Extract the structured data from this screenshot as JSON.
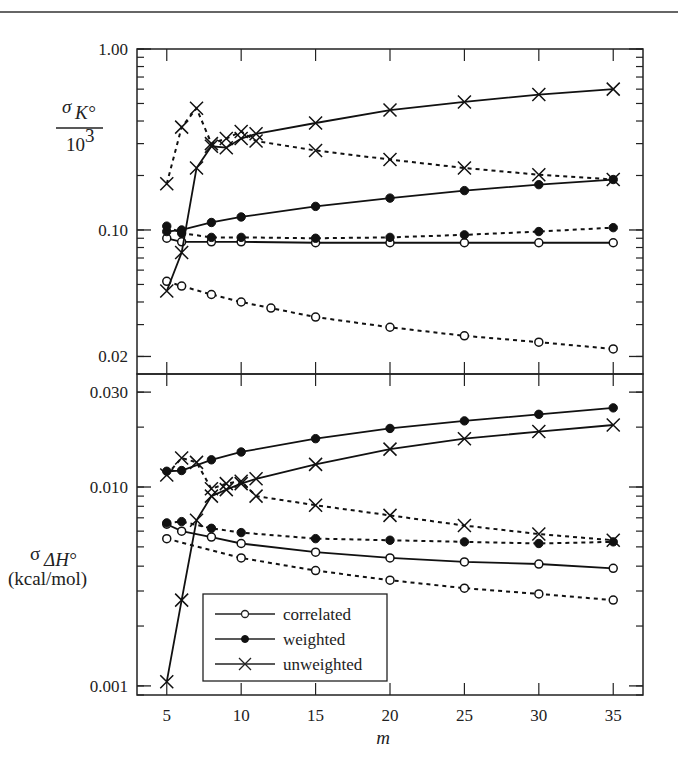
{
  "chart_data": [
    {
      "type": "line",
      "panel": "top",
      "yscale": "log",
      "ylim": [
        0.016,
        1.0
      ],
      "ylabel_symbol": "σ",
      "ylabel_subscript": "K°",
      "ylabel_denominator": "10",
      "ylabel_denominator_exp": "3",
      "yticks": [
        1.0,
        0.1,
        0.02
      ],
      "ytick_labels": [
        "1.00",
        "0.10",
        "0.02"
      ],
      "series": [
        {
          "name": "correlated",
          "style": "solid",
          "marker": "open-circle",
          "x": [
            5,
            6,
            8,
            10,
            15,
            20,
            25,
            30,
            35
          ],
          "y": [
            0.09,
            0.086,
            0.086,
            0.086,
            0.085,
            0.085,
            0.085,
            0.085,
            0.085
          ]
        },
        {
          "name": "correlated",
          "style": "dotted",
          "marker": "open-circle",
          "x": [
            5,
            6,
            8,
            10,
            12,
            15,
            20,
            25,
            30,
            35
          ],
          "y": [
            0.052,
            0.049,
            0.044,
            0.04,
            0.037,
            0.033,
            0.029,
            0.026,
            0.024,
            0.022
          ]
        },
        {
          "name": "weighted",
          "style": "solid",
          "marker": "filled-circle",
          "x": [
            5,
            6,
            8,
            10,
            15,
            20,
            25,
            30,
            35
          ],
          "y": [
            0.098,
            0.1,
            0.11,
            0.118,
            0.135,
            0.15,
            0.165,
            0.178,
            0.19
          ]
        },
        {
          "name": "weighted",
          "style": "dotted",
          "marker": "filled-circle",
          "x": [
            5,
            6,
            8,
            10,
            15,
            20,
            25,
            30,
            35
          ],
          "y": [
            0.105,
            0.096,
            0.091,
            0.091,
            0.09,
            0.091,
            0.094,
            0.098,
            0.103
          ]
        },
        {
          "name": "unweighted",
          "style": "solid",
          "marker": "x",
          "x": [
            5,
            6,
            7,
            8,
            9,
            10,
            11,
            15,
            20,
            25,
            30,
            35
          ],
          "y": [
            0.046,
            0.075,
            0.22,
            0.29,
            0.285,
            0.32,
            0.34,
            0.39,
            0.46,
            0.51,
            0.56,
            0.6
          ]
        },
        {
          "name": "unweighted",
          "style": "dotted",
          "marker": "x",
          "x": [
            5,
            6,
            7,
            8,
            9,
            10,
            11,
            15,
            20,
            25,
            30,
            35
          ],
          "y": [
            0.18,
            0.37,
            0.47,
            0.3,
            0.32,
            0.35,
            0.31,
            0.275,
            0.245,
            0.22,
            0.202,
            0.19
          ]
        }
      ]
    },
    {
      "type": "line",
      "panel": "bottom",
      "yscale": "log",
      "ylim": [
        0.0009,
        0.037
      ],
      "xlim": [
        3,
        37
      ],
      "ylabel_symbol": "σ",
      "ylabel_subscript": "ΔH°",
      "ylabel_units": "(kcal/mol)",
      "xlabel": "m",
      "xticks": [
        5,
        10,
        15,
        20,
        25,
        30,
        35
      ],
      "xtick_labels": [
        "5",
        "10",
        "15",
        "20",
        "25",
        "30",
        "35"
      ],
      "yticks": [
        0.03,
        0.01,
        0.001
      ],
      "ytick_labels": [
        "0.030",
        "0.010",
        "0.001"
      ],
      "series": [
        {
          "name": "correlated",
          "style": "solid",
          "marker": "open-circle",
          "x": [
            5,
            6,
            8,
            10,
            15,
            20,
            25,
            30,
            35
          ],
          "y": [
            0.0065,
            0.006,
            0.0056,
            0.0052,
            0.0047,
            0.0044,
            0.0042,
            0.0041,
            0.0039
          ]
        },
        {
          "name": "correlated",
          "style": "dotted",
          "marker": "open-circle",
          "x": [
            5,
            10,
            15,
            20,
            25,
            30,
            35
          ],
          "y": [
            0.0055,
            0.0044,
            0.0038,
            0.0034,
            0.0031,
            0.0029,
            0.0027
          ]
        },
        {
          "name": "weighted",
          "style": "solid",
          "marker": "filled-circle",
          "x": [
            5,
            6,
            8,
            10,
            15,
            20,
            25,
            30,
            35
          ],
          "y": [
            0.012,
            0.0121,
            0.0137,
            0.015,
            0.0175,
            0.0197,
            0.0215,
            0.0232,
            0.025
          ]
        },
        {
          "name": "weighted",
          "style": "dotted",
          "marker": "filled-circle",
          "x": [
            5,
            6,
            8,
            10,
            15,
            20,
            25,
            30,
            35
          ],
          "y": [
            0.0066,
            0.0067,
            0.0062,
            0.0059,
            0.0055,
            0.0054,
            0.0053,
            0.0052,
            0.0053
          ]
        },
        {
          "name": "unweighted",
          "style": "solid",
          "marker": "x",
          "x": [
            5,
            6,
            7,
            8,
            9,
            10,
            11,
            15,
            20,
            25,
            30,
            35
          ],
          "y": [
            0.00105,
            0.0027,
            0.0068,
            0.009,
            0.0097,
            0.0104,
            0.011,
            0.013,
            0.0155,
            0.0175,
            0.019,
            0.0205
          ]
        },
        {
          "name": "unweighted",
          "style": "dotted",
          "marker": "x",
          "x": [
            5,
            6,
            7,
            8,
            9,
            10,
            11,
            15,
            20,
            25,
            30,
            35
          ],
          "y": [
            0.0115,
            0.014,
            0.0133,
            0.0098,
            0.0104,
            0.0107,
            0.009,
            0.0081,
            0.0072,
            0.0064,
            0.0058,
            0.0054
          ]
        }
      ],
      "legend": {
        "placement": "lower-left",
        "entries": [
          {
            "label": "correlated",
            "marker": "open-circle"
          },
          {
            "label": "weighted",
            "marker": "filled-circle"
          },
          {
            "label": "unweighted",
            "marker": "x"
          }
        ]
      }
    }
  ]
}
